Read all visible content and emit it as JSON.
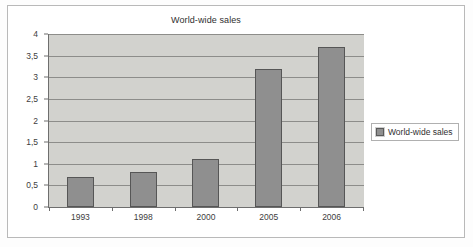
{
  "chart_data": {
    "type": "bar",
    "title": "World-wide sales",
    "xlabel": "",
    "ylabel": "",
    "categories": [
      "1993",
      "1998",
      "2000",
      "2005",
      "2006"
    ],
    "values": [
      0.7,
      0.8,
      1.1,
      3.2,
      3.7
    ],
    "series": [
      {
        "name": "World-wide sales",
        "values": [
          0.7,
          0.8,
          1.1,
          3.2,
          3.7
        ]
      }
    ],
    "ylim": [
      0,
      4
    ],
    "ytick_step": 0.5,
    "ytick_labels": [
      "4",
      "3,5",
      "3",
      "2,5",
      "2",
      "1,5",
      "1",
      "0,5",
      "0"
    ],
    "ytick_values": [
      4,
      3.5,
      3,
      2.5,
      2,
      1.5,
      1,
      0.5,
      0
    ],
    "decimal_separator": ",",
    "grid": true,
    "grid_axis": "y",
    "legend_position": "right",
    "legend_entries": [
      "World-wide sales"
    ],
    "colors": {
      "bar_fill": "#8f8f8f",
      "bar_border": "#565656",
      "plot_background": "#d2d2ce",
      "gridline": "#8d8d8a",
      "axis": "#6e6e6e",
      "page_background": "#ffffff",
      "frame_border": "#b9b9b9",
      "text": "#3a3a3a"
    }
  }
}
